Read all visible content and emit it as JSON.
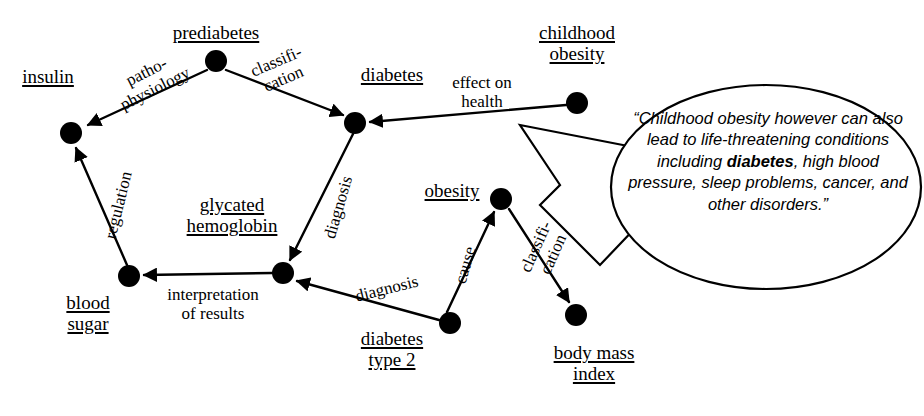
{
  "diagram": {
    "type": "concept-map",
    "nodes": [
      {
        "id": "insulin",
        "label_lines": [
          "insulin"
        ],
        "x": 71,
        "y": 133,
        "label_x": 48,
        "label_y": 66,
        "r": 11
      },
      {
        "id": "prediabetes",
        "label_lines": [
          "prediabetes"
        ],
        "x": 216,
        "y": 61,
        "label_x": 172,
        "label_y": 22,
        "r": 11
      },
      {
        "id": "diabetes",
        "label_lines": [
          "diabetes"
        ],
        "x": 355,
        "y": 123,
        "label_x": 390,
        "label_y": 64,
        "r": 11
      },
      {
        "id": "childhood-obesity",
        "label_lines": [
          "childhood",
          "obesity"
        ],
        "x": 577,
        "y": 103,
        "label_x": 577,
        "label_y": 22,
        "r": 11
      },
      {
        "id": "blood-sugar",
        "label_lines": [
          "blood",
          "sugar"
        ],
        "x": 129,
        "y": 276,
        "label_x": 88,
        "label_y": 292,
        "r": 11
      },
      {
        "id": "glycated-hemoglobin",
        "label_lines": [
          "glycated",
          "hemoglobin"
        ],
        "x": 283,
        "y": 273,
        "label_x": 232,
        "label_y": 192,
        "r": 11
      },
      {
        "id": "obesity",
        "label_lines": [
          "obesity"
        ],
        "x": 501,
        "y": 199,
        "label_x": 449,
        "label_y": 180,
        "r": 11
      },
      {
        "id": "diabetes-type-2",
        "label_lines": [
          "diabetes",
          "type 2"
        ],
        "x": 450,
        "y": 323,
        "label_x": 390,
        "label_y": 327,
        "r": 11
      },
      {
        "id": "body-mass-index",
        "label_lines": [
          "body mass",
          "index"
        ],
        "x": 576,
        "y": 315,
        "label_x": 590,
        "label_y": 341,
        "r": 11
      }
    ],
    "edges": [
      {
        "id": "prediabetes-insulin",
        "from": "prediabetes",
        "to": "insulin",
        "label_lines": [
          "patho-",
          "physiology"
        ],
        "label_x": 148,
        "label_y": 84,
        "rotate": -27
      },
      {
        "id": "prediabetes-diabetes",
        "from": "prediabetes",
        "to": "diabetes",
        "label_lines": [
          "classifi-",
          "cation"
        ],
        "label_x": 283,
        "label_y": 73,
        "rotate": -23
      },
      {
        "id": "childhood-obesity-diabetes",
        "from": "childhood-obesity",
        "to": "diabetes",
        "label_lines": [
          "effect on",
          "health"
        ],
        "label_x": 480,
        "label_y": 94,
        "rotate": 0
      },
      {
        "id": "diabetes-glycated-hemoglobin",
        "from": "diabetes",
        "to": "glycated-hemoglobin",
        "label_lines": [
          "diagnosis"
        ],
        "label_x": 335,
        "label_y": 208,
        "rotate": -74
      },
      {
        "id": "glycated-hemoglobin-blood-sugar",
        "from": "glycated-hemoglobin",
        "to": "blood-sugar",
        "label_lines": [
          "interpretation",
          "of results"
        ],
        "label_x": 210,
        "label_y": 285,
        "rotate": 0
      },
      {
        "id": "blood-sugar-insulin",
        "from": "blood-sugar",
        "to": "insulin",
        "label_lines": [
          "regulation"
        ],
        "label_x": 117,
        "label_y": 205,
        "rotate": -76
      },
      {
        "id": "diabetes-type-2-glycated-hemoglobin",
        "from": "diabetes-type-2",
        "to": "glycated-hemoglobin",
        "label_lines": [
          "diagnosis"
        ],
        "label_x": 387,
        "label_y": 289,
        "rotate": -14
      },
      {
        "id": "diabetes-type-2-obesity",
        "from": "diabetes-type-2",
        "to": "obesity",
        "label_lines": [
          "cause"
        ],
        "label_x": 466,
        "label_y": 265,
        "rotate": -74
      },
      {
        "id": "obesity-body-mass-index",
        "from": "obesity",
        "to": "body-mass-index",
        "label_lines": [
          "classifi-",
          "cation"
        ],
        "label_x": 545,
        "label_y": 250,
        "rotate": -66
      }
    ],
    "callout": {
      "anchor_node": "childhood-obesity",
      "quote_prefix": "“Childhood obesity however can also lead to life-threatening conditions including ",
      "quote_bold": "diabetes",
      "quote_suffix": ", high blood pressure, sleep problems, cancer, and other disorders.”"
    },
    "colors": {
      "stroke": "#000000",
      "node_fill": "#000000",
      "background": "#ffffff"
    }
  }
}
